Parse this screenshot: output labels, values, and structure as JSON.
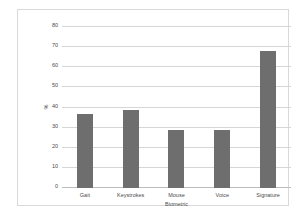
{
  "chart_data": {
    "type": "bar",
    "title": "",
    "categories": [
      "Gait",
      "Keystrokes",
      "Mouse",
      "Voice",
      "Signature"
    ],
    "values": [
      37,
      39,
      29,
      29,
      68
    ],
    "xlabel": "Biometric",
    "ylabel": "%",
    "ylim": [
      0,
      80
    ],
    "yticks": [
      0,
      10,
      20,
      30,
      40,
      50,
      60,
      70,
      80
    ],
    "ytick_labels": [
      "0",
      "10",
      "20",
      "30",
      "40",
      "50",
      "60",
      "70",
      "80"
    ],
    "grid": true,
    "legend": false,
    "bar_color": "#6e6e6e",
    "gridline_color": "#d6d6d6",
    "axis_color": "#bdbdbd",
    "plot_background": "#ffffff",
    "frame_border_color": "#d9d9d9"
  }
}
